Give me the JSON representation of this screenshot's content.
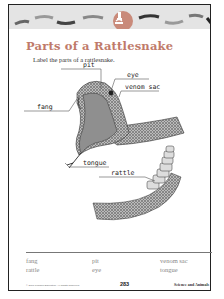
{
  "worksheet": {
    "title": "Parts of a Rattlesnake",
    "instruction": "Label the parts of a rattlesnake.",
    "banner_icon": "microscope-icon",
    "colors": {
      "title": "#c07a6a",
      "badge": "#c98a7a",
      "banner": "#e4e4e4"
    }
  },
  "diagram": {
    "labels": {
      "pit": "pit",
      "eye": "eye",
      "venom_sac": "venom sac",
      "fang": "fang",
      "tongue": "tongue",
      "rattle": "rattle"
    }
  },
  "word_bank": [
    [
      "fang",
      "pit",
      "venom sac"
    ],
    [
      "rattle",
      "eye",
      "tongue"
    ]
  ],
  "footer": {
    "copyright": "© 2001 Pearson Education. All Rights Reserved.",
    "page_number": "283",
    "subject": "Science and Animals"
  }
}
